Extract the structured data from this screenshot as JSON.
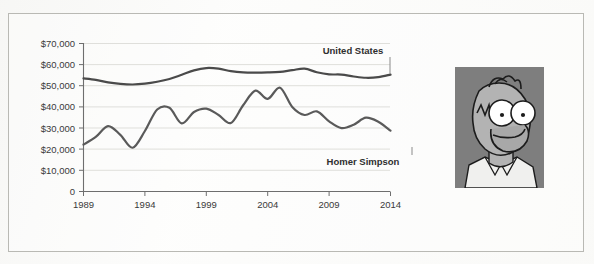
{
  "figure": {
    "frame_border_color": "#b9b9b4",
    "background_color": "#fdfdfc"
  },
  "portrait": {
    "name": "homer-simpson-portrait",
    "alt": "Homer Simpson",
    "background_color": "#7e7e7e",
    "skin_color": "#b3b3b3",
    "line_color": "#1c1c1c",
    "shirt_color": "#f2f2f0"
  },
  "chart_data": {
    "type": "line",
    "title": "",
    "subtitle": "",
    "xlabel": "",
    "ylabel": "",
    "grid": true,
    "legend_position": "inline-annotation",
    "xlim": [
      1989,
      2014
    ],
    "ylim": [
      0,
      70000
    ],
    "x_tick_labels": [
      "1989",
      "1994",
      "1999",
      "2004",
      "2009",
      "2014"
    ],
    "x_ticks": [
      1989,
      1994,
      1999,
      2004,
      2009,
      2014
    ],
    "y_tick_labels": [
      "$70,000",
      "$60,000",
      "$50,000",
      "$40,000",
      "$30,000",
      "$20,000",
      "$10,000",
      "0"
    ],
    "y_ticks": [
      70000,
      60000,
      50000,
      40000,
      30000,
      20000,
      10000,
      0
    ],
    "x": [
      1989,
      1990,
      1991,
      1992,
      1993,
      1994,
      1995,
      1996,
      1997,
      1998,
      1999,
      2000,
      2001,
      2002,
      2003,
      2004,
      2005,
      2006,
      2007,
      2008,
      2009,
      2010,
      2011,
      2012,
      2013,
      2014
    ],
    "series": [
      {
        "name": "United States",
        "color": "#4a4a4a",
        "label_text": "United States",
        "values": [
          53500,
          52800,
          51600,
          50900,
          50600,
          51000,
          51900,
          53200,
          55200,
          57300,
          58400,
          58100,
          56900,
          56300,
          56200,
          56300,
          56600,
          57400,
          58100,
          56400,
          55400,
          55300,
          54400,
          53800,
          54100,
          55300
        ]
      },
      {
        "name": "Homer Simpson",
        "color": "#5a5a5a",
        "label_text": "Homer Simpson",
        "values": [
          22200,
          25800,
          30900,
          26800,
          20700,
          28600,
          38800,
          39600,
          32200,
          37600,
          39200,
          36200,
          32400,
          40800,
          47700,
          43800,
          49100,
          40000,
          36200,
          37900,
          33200,
          30000,
          31600,
          34900,
          33000,
          28800
        ]
      }
    ],
    "annotations": [
      {
        "name": "united-states-label",
        "text": "United States",
        "x_px": 353,
        "y_px": 54,
        "leader_to_x_px": 390,
        "leader_to_y_px": 74
      },
      {
        "name": "homer-simpson-label",
        "text": "Homer Simpson",
        "x_px": 363,
        "y_px": 165,
        "leader_to_x_px": 412,
        "leader_to_y_px": 147
      }
    ],
    "colors": {
      "grid": "#dcdcd8",
      "axis": "#6e6e6e",
      "tick_label": "#3a3a3a"
    }
  }
}
